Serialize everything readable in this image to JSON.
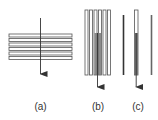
{
  "figure": {
    "panels": [
      {
        "id": "a",
        "label": "(a)",
        "description": "stack of horizontal plates with vertical arrow passing through"
      },
      {
        "id": "b",
        "label": "(b)",
        "description": "stack of vertical plates with arrow traveling along center plate"
      },
      {
        "id": "c",
        "label": "(c)",
        "description": "single vertical plate with arrow, flanked by two thin plates"
      }
    ],
    "colors": {
      "plate_stroke": "#555555",
      "plate_fill": "#ffffff",
      "shaded_fill": "#777777",
      "arrow": "#333333",
      "dark_line": "#333333",
      "gray_line": "#666666"
    }
  }
}
